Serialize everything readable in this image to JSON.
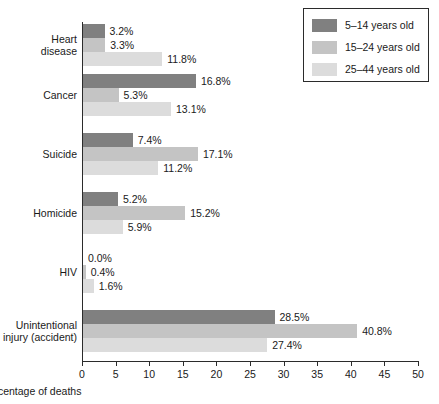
{
  "chart_data": {
    "type": "bar",
    "orientation": "horizontal",
    "title": "",
    "xlabel": "Percentage of deaths",
    "ylabel": "",
    "xlim": [
      0,
      50
    ],
    "xticks": [
      0,
      5,
      10,
      15,
      20,
      25,
      30,
      35,
      40,
      45,
      50
    ],
    "grid": false,
    "legend_position": "top-right",
    "categories": [
      "Heart disease",
      "Cancer",
      "Suicide",
      "Homicide",
      "HIV",
      "Unintentional injury (accident)"
    ],
    "series": [
      {
        "name": "5–14 years old",
        "color": "#808080",
        "values": [
          3.2,
          16.8,
          7.4,
          5.2,
          0.0,
          28.5
        ],
        "labels": [
          "3.2%",
          "16.8%",
          "7.4%",
          "5.2%",
          "0.0%",
          "28.5%"
        ]
      },
      {
        "name": "15–24 years old",
        "color": "#c4c4c4",
        "values": [
          3.3,
          5.3,
          17.1,
          15.2,
          0.4,
          40.8
        ],
        "labels": [
          "3.3%",
          "5.3%",
          "17.1%",
          "15.2%",
          "0.4%",
          "40.8%"
        ]
      },
      {
        "name": "25–44 years old",
        "color": "#dcdcdc",
        "values": [
          11.8,
          13.1,
          11.2,
          5.9,
          1.6,
          27.4
        ],
        "labels": [
          "11.8%",
          "13.1%",
          "11.2%",
          "5.9%",
          "1.6%",
          "27.4%"
        ]
      }
    ]
  },
  "category_lines": [
    [
      "Heart",
      "disease"
    ],
    [
      "Cancer"
    ],
    [
      "Suicide"
    ],
    [
      "Homicide"
    ],
    [
      "HIV"
    ],
    [
      "Unintentional",
      "injury (accident)"
    ]
  ],
  "legend": {
    "items": [
      {
        "label": "5–14 years old",
        "color": "#808080"
      },
      {
        "label": "15–24 years old",
        "color": "#c4c4c4"
      },
      {
        "label": "25–44 years old",
        "color": "#dcdcdc"
      }
    ]
  },
  "axis": {
    "x_label": "Percentage of deaths",
    "tick_labels": [
      "0",
      "5",
      "10",
      "15",
      "20",
      "25",
      "30",
      "35",
      "40",
      "45",
      "50"
    ]
  }
}
